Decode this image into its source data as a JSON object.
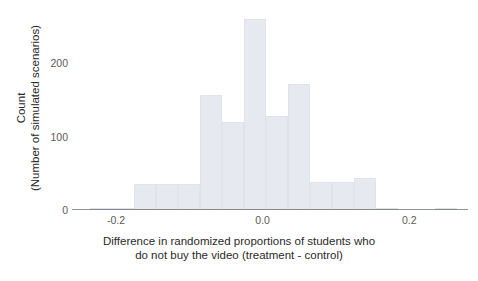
{
  "chart_data": {
    "type": "bar",
    "title": "",
    "subtitle": "",
    "xlabel_line1": "Difference in randomized proportions of students who",
    "xlabel_line2": "do not buy the video (treatment - control)",
    "ylabel_line1": "Count",
    "ylabel_line2": "(Number of simulated scenarios)",
    "xtick_labels": [
      "-0.2",
      "0.0",
      "0.2"
    ],
    "xtick_values": [
      -0.2,
      0.0,
      0.2
    ],
    "ytick_labels": [
      "0",
      "100",
      "200"
    ],
    "ytick_values": [
      0,
      100,
      200
    ],
    "xlim": [
      -0.26,
      0.28
    ],
    "ylim": [
      0,
      275
    ],
    "grid": false,
    "legend": "none",
    "bin_width": 0.03,
    "bar_color": "#e6eaf0",
    "bar_edge_color": "#dfe4ec",
    "axis_color": "#3a3a3a",
    "bins": [
      {
        "left": -0.235,
        "right": -0.205,
        "center": -0.22,
        "count": 2
      },
      {
        "left": -0.205,
        "right": -0.175,
        "center": -0.19,
        "count": 3
      },
      {
        "left": -0.175,
        "right": -0.145,
        "center": -0.16,
        "count": 36
      },
      {
        "left": -0.145,
        "right": -0.115,
        "center": -0.13,
        "count": 36
      },
      {
        "left": -0.115,
        "right": -0.085,
        "center": -0.1,
        "count": 36
      },
      {
        "left": -0.085,
        "right": -0.055,
        "center": -0.07,
        "count": 157
      },
      {
        "left": -0.055,
        "right": -0.025,
        "center": -0.04,
        "count": 120
      },
      {
        "left": -0.025,
        "right": 0.005,
        "center": -0.01,
        "count": 260
      },
      {
        "left": 0.005,
        "right": 0.035,
        "center": 0.02,
        "count": 128
      },
      {
        "left": 0.035,
        "right": 0.065,
        "center": 0.05,
        "count": 172
      },
      {
        "left": 0.065,
        "right": 0.095,
        "center": 0.08,
        "count": 38
      },
      {
        "left": 0.095,
        "right": 0.125,
        "center": 0.11,
        "count": 38
      },
      {
        "left": 0.125,
        "right": 0.155,
        "center": 0.14,
        "count": 43
      },
      {
        "left": 0.155,
        "right": 0.185,
        "center": 0.17,
        "count": 2
      },
      {
        "left": 0.235,
        "right": 0.265,
        "center": 0.25,
        "count": 2
      }
    ]
  }
}
